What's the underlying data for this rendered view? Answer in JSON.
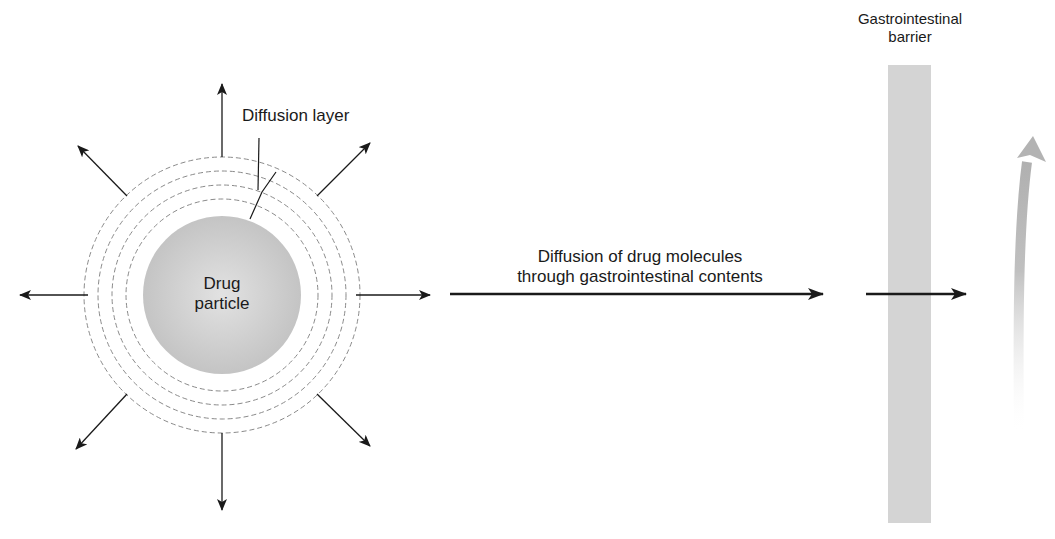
{
  "labels": {
    "diffusion_layer": "Diffusion layer",
    "drug_particle_line1": "Drug",
    "drug_particle_line2": "particle",
    "diffusion_arrow_line1": "Diffusion of drug molecules",
    "diffusion_arrow_line2": "through gastrointestinal contents",
    "barrier_line1": "Gastrointestinal",
    "barrier_line2": "barrier"
  },
  "colors": {
    "particle_fill": "#c8c8c8",
    "barrier_fill": "#d4d4d4",
    "dashed_layers": "#8a8a8a",
    "arrows": "#1a1a1a",
    "absorption_arrow": "#b8b8b8"
  },
  "geometry": {
    "particle_center": [
      222,
      295
    ],
    "particle_radius": 79,
    "diffusion_layer_radii": [
      96,
      110,
      124,
      138
    ],
    "radial_arrow_count": 8
  }
}
